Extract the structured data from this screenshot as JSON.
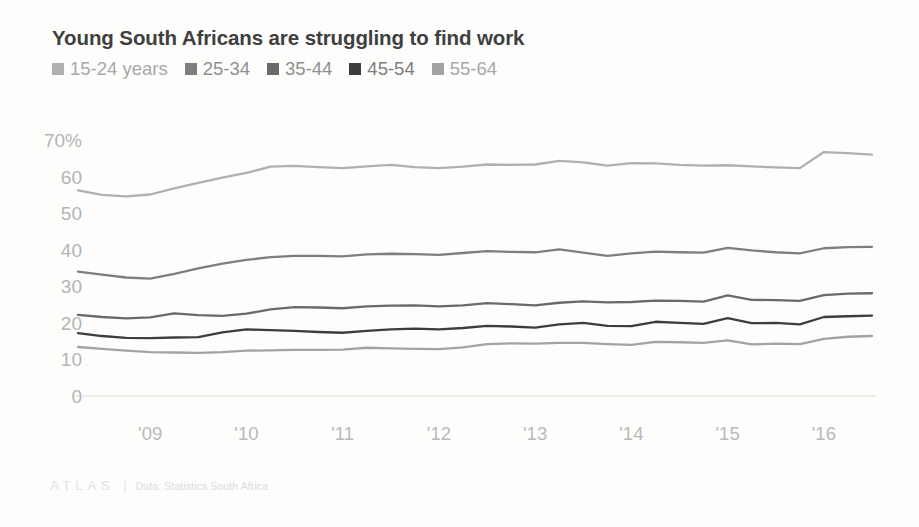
{
  "header": {
    "title": "Young South Africans are struggling to find work"
  },
  "legend": {
    "position": "top-left",
    "items": [
      {
        "label": "15-24 years",
        "color": "#b0b0b0"
      },
      {
        "label": "25-34",
        "color": "#7e7e7e"
      },
      {
        "label": "35-44",
        "color": "#6a6a6a"
      },
      {
        "label": "45-54",
        "color": "#3d3d3d"
      },
      {
        "label": "55-64",
        "color": "#a3a3a3"
      }
    ]
  },
  "footer": {
    "logo": "ATLAS",
    "divider": "|",
    "source": "Data: Statistics South Africa"
  },
  "axes": {
    "y_ticks": [
      "70%",
      "60",
      "50",
      "40",
      "30",
      "20",
      "10",
      "0"
    ],
    "x_ticks": [
      "'09",
      "'10",
      "'11",
      "'12",
      "'13",
      "'14",
      "'15",
      "'16"
    ]
  },
  "chart_data": {
    "type": "line",
    "title": "Young South Africans are struggling to find work",
    "subtitle": "",
    "xlabel": "",
    "ylabel": "",
    "ylim": [
      0,
      70
    ],
    "xlim": [
      2008.25,
      2016.5
    ],
    "grid": false,
    "legend_position": "top-left",
    "y_unit": "%",
    "source": "Data: Statistics South Africa",
    "x": [
      2008.25,
      2008.5,
      2008.75,
      2009.0,
      2009.25,
      2009.5,
      2009.75,
      2010.0,
      2010.25,
      2010.5,
      2010.75,
      2011.0,
      2011.25,
      2011.5,
      2011.75,
      2012.0,
      2012.25,
      2012.5,
      2012.75,
      2013.0,
      2013.25,
      2013.5,
      2013.75,
      2014.0,
      2014.25,
      2014.5,
      2014.75,
      2015.0,
      2015.25,
      2015.5,
      2015.75,
      2016.0,
      2016.25,
      2016.5
    ],
    "x_tick_values": [
      2009,
      2010,
      2011,
      2012,
      2013,
      2014,
      2015,
      2016
    ],
    "x_tick_labels": [
      "'09",
      "'10",
      "'11",
      "'12",
      "'13",
      "'14",
      "'15",
      "'16"
    ],
    "y_tick_values": [
      70,
      60,
      50,
      40,
      30,
      20,
      10,
      0
    ],
    "y_tick_labels": [
      "70%",
      "60",
      "50",
      "40",
      "30",
      "20",
      "10",
      "0"
    ],
    "series": [
      {
        "name": "15-24 years",
        "color": "#b0b0b0",
        "values": [
          56.2,
          55.0,
          54.6,
          55.1,
          56.8,
          58.3,
          59.7,
          61.0,
          62.7,
          62.9,
          62.6,
          62.3,
          62.8,
          63.2,
          62.6,
          62.3,
          62.7,
          63.3,
          63.2,
          63.3,
          64.3,
          63.9,
          63.0,
          63.7,
          63.6,
          63.2,
          63.0,
          63.1,
          62.8,
          62.5,
          62.3,
          66.7,
          66.4,
          66.0
        ]
      },
      {
        "name": "25-34",
        "color": "#7e7e7e",
        "values": [
          34.0,
          33.2,
          32.4,
          32.1,
          33.4,
          34.9,
          36.2,
          37.2,
          38.0,
          38.3,
          38.3,
          38.2,
          38.7,
          38.9,
          38.8,
          38.6,
          39.1,
          39.6,
          39.4,
          39.3,
          40.1,
          39.2,
          38.3,
          39.0,
          39.5,
          39.3,
          39.2,
          40.5,
          39.8,
          39.3,
          39.0,
          40.4,
          40.7,
          40.8
        ]
      },
      {
        "name": "35-44",
        "color": "#6a6a6a",
        "values": [
          22.2,
          21.6,
          21.2,
          21.5,
          22.6,
          22.1,
          21.9,
          22.5,
          23.7,
          24.3,
          24.2,
          24.0,
          24.5,
          24.7,
          24.8,
          24.5,
          24.8,
          25.4,
          25.1,
          24.8,
          25.5,
          25.9,
          25.6,
          25.7,
          26.1,
          26.0,
          25.8,
          27.5,
          26.3,
          26.2,
          26.0,
          27.6,
          28.0,
          28.1
        ]
      },
      {
        "name": "45-54",
        "color": "#3d3d3d",
        "values": [
          17.2,
          16.4,
          15.9,
          15.8,
          16.0,
          16.1,
          17.4,
          18.2,
          18.0,
          17.8,
          17.5,
          17.3,
          17.8,
          18.2,
          18.4,
          18.2,
          18.6,
          19.2,
          19.0,
          18.7,
          19.6,
          20.0,
          19.2,
          19.1,
          20.3,
          20.0,
          19.7,
          21.3,
          19.9,
          20.0,
          19.6,
          21.6,
          21.8,
          22.0
        ]
      },
      {
        "name": "55-64",
        "color": "#a3a3a3",
        "values": [
          13.4,
          12.9,
          12.4,
          12.0,
          11.9,
          11.8,
          12.0,
          12.4,
          12.5,
          12.6,
          12.6,
          12.7,
          13.2,
          13.0,
          12.9,
          12.8,
          13.3,
          14.2,
          14.4,
          14.3,
          14.5,
          14.5,
          14.2,
          14.0,
          14.8,
          14.7,
          14.5,
          15.2,
          14.1,
          14.3,
          14.2,
          15.6,
          16.2,
          16.4
        ]
      }
    ]
  }
}
